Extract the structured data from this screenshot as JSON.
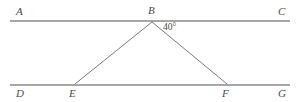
{
  "diagram": {
    "kind": "geometry-figure",
    "canvas": {
      "width": 297,
      "height": 102,
      "background": "#ffffff"
    },
    "colors": {
      "parallel_line": "#8a8a8a",
      "triangle_line": "#7a7a7a",
      "label_text": "#4a4a4a"
    },
    "lines": [
      {
        "name": "top-parallel-line",
        "label_start": "A",
        "label_mid": "B",
        "label_end": "C",
        "x1": 10,
        "y1": 21,
        "x2": 290,
        "y2": 21,
        "stroke_width": 1.6
      },
      {
        "name": "bottom-parallel-line",
        "label_start": "D",
        "label_mid_left": "E",
        "label_mid_right": "F",
        "label_end": "G",
        "x1": 10,
        "y1": 85,
        "x2": 290,
        "y2": 85,
        "stroke_width": 1.6
      }
    ],
    "triangle": {
      "name": "triangle-BEF",
      "vertices": [
        {
          "id": "B",
          "x": 152,
          "y": 22
        },
        {
          "id": "E",
          "x": 75,
          "y": 84
        },
        {
          "id": "F",
          "x": 227,
          "y": 84
        }
      ],
      "stroke_width": 1.0
    },
    "points": [
      {
        "id": "A",
        "label": "A",
        "x": 16,
        "y": 6,
        "on": "top-line-left-end"
      },
      {
        "id": "B",
        "label": "B",
        "x": 148,
        "y": 5,
        "on": "top-line-apex"
      },
      {
        "id": "C",
        "label": "C",
        "x": 278,
        "y": 6,
        "on": "top-line-right-end"
      },
      {
        "id": "D",
        "label": "D",
        "x": 16,
        "y": 88,
        "on": "bottom-line-left-end"
      },
      {
        "id": "E",
        "label": "E",
        "x": 69,
        "y": 88,
        "on": "bottom-line-left-vertex"
      },
      {
        "id": "F",
        "label": "F",
        "x": 222,
        "y": 88,
        "on": "bottom-line-right-vertex"
      },
      {
        "id": "G",
        "label": "G",
        "x": 278,
        "y": 88,
        "on": "bottom-line-right-end"
      }
    ],
    "angles": [
      {
        "id": "angle-CBF",
        "value": "40",
        "unit": "°",
        "text": "40°",
        "x": 163,
        "y": 23,
        "at_vertex": "B",
        "between": [
          "B-C",
          "B-F"
        ]
      }
    ]
  }
}
